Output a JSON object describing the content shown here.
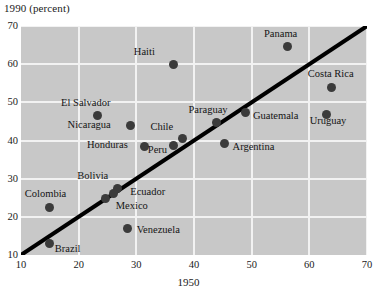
{
  "chart_data": {
    "type": "scatter",
    "title": "",
    "ylabel": "1990 (percent)",
    "xlabel": "1950",
    "xlim": [
      10,
      70
    ],
    "ylim": [
      10,
      70
    ],
    "xticks": [
      10,
      20,
      30,
      40,
      50,
      60,
      70
    ],
    "yticks": [
      10,
      20,
      30,
      40,
      50,
      60,
      70
    ],
    "grid": true,
    "legend": "none",
    "plot_background": "#c8c8c8",
    "point_color": "#3b3b3b",
    "line_color": "#000000",
    "reference_line": {
      "label": "",
      "x": [
        10,
        70
      ],
      "y": [
        10,
        70
      ]
    },
    "points": [
      {
        "name": "Haiti",
        "x": 36.5,
        "y": 60.0,
        "label_dx": -40,
        "label_dy": -13
      },
      {
        "name": "Panama",
        "x": 56.3,
        "y": 64.5,
        "label_dx": -24,
        "label_dy": -14
      },
      {
        "name": "Costa Rica",
        "x": 63.9,
        "y": 54.0,
        "label_dx": -24,
        "label_dy": -14
      },
      {
        "name": "El Salvador",
        "x": 23.2,
        "y": 46.5,
        "label_dx": -36,
        "label_dy": -14
      },
      {
        "name": "Nicaragua",
        "x": 29.0,
        "y": 44.0,
        "label_dx": -63,
        "label_dy": -1
      },
      {
        "name": "Paraguay",
        "x": 43.9,
        "y": 44.7,
        "label_dx": -28,
        "label_dy": -14
      },
      {
        "name": "Guatemala",
        "x": 49.0,
        "y": 47.3,
        "label_dx": 7,
        "label_dy": 2
      },
      {
        "name": "Uruguay",
        "x": 63.0,
        "y": 46.8,
        "label_dx": -17,
        "label_dy": 5
      },
      {
        "name": "Chile",
        "x": 38.0,
        "y": 40.5,
        "label_dx": -32,
        "label_dy": -13
      },
      {
        "name": "Honduras",
        "x": 31.5,
        "y": 38.5,
        "label_dx": -58,
        "label_dy": -2
      },
      {
        "name": "Peru",
        "x": 36.5,
        "y": 38.6,
        "label_dx": -26,
        "label_dy": 3
      },
      {
        "name": "Argentina",
        "x": 45.3,
        "y": 39.2,
        "label_dx": 8,
        "label_dy": 2
      },
      {
        "name": "Bolivia",
        "x": 26.7,
        "y": 27.5,
        "label_dx": -40,
        "label_dy": -13
      },
      {
        "name": "Ecuador",
        "x": 26.0,
        "y": 26.2,
        "label_dx": 17,
        "label_dy": -2
      },
      {
        "name": "Mexico",
        "x": 24.7,
        "y": 24.8,
        "label_dx": 10,
        "label_dy": 6
      },
      {
        "name": "Colombia",
        "x": 15.0,
        "y": 22.5,
        "label_dx": -25,
        "label_dy": -14
      },
      {
        "name": "Venezuela",
        "x": 28.5,
        "y": 17.0,
        "label_dx": 9,
        "label_dy": 1
      },
      {
        "name": "Brazil",
        "x": 15.0,
        "y": 13.0,
        "label_dx": 5,
        "label_dy": 4
      }
    ]
  }
}
